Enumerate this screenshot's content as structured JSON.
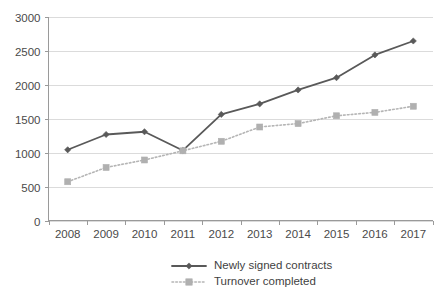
{
  "chart_data": {
    "type": "line",
    "title": "",
    "subtitle": "",
    "xlabel": "",
    "ylabel": "",
    "categories": [
      "2008",
      "2009",
      "2010",
      "2011",
      "2012",
      "2013",
      "2014",
      "2015",
      "2016",
      "2017"
    ],
    "series": [
      {
        "name": "Newly signed contracts",
        "values": [
          1040,
          1265,
          1305,
          1030,
          1560,
          1715,
          1920,
          2100,
          2435,
          2640
        ],
        "color": "#595959",
        "line_style": "solid",
        "marker": "diamond"
      },
      {
        "name": "Turnover completed",
        "values": [
          570,
          780,
          890,
          1025,
          1165,
          1375,
          1425,
          1540,
          1590,
          1680
        ],
        "color": "#b0b0b0",
        "line_style": "dotted",
        "marker": "square"
      }
    ],
    "ylim": [
      0,
      3000
    ],
    "yticks": [
      0,
      500,
      1000,
      1500,
      2000,
      2500,
      3000
    ],
    "ytick_labels": [
      "0",
      "500",
      "1000",
      "1500",
      "2000",
      "2500",
      "3000"
    ],
    "xtick_labels": [
      "2008",
      "2009",
      "2010",
      "2011",
      "2012",
      "2013",
      "2014",
      "2015",
      "2016",
      "2017"
    ],
    "grid": true,
    "grid_axis": "y",
    "legend_position": "bottom",
    "legend_entries": [
      "Newly signed contracts",
      "Turnover completed"
    ],
    "annotations": [],
    "colors": {
      "series_1": "#595959",
      "series_2": "#b0b0b0",
      "gridline": "#d2d2d2",
      "axis": "#9a9a9a",
      "text": "#4a4a4a",
      "background": "#ffffff"
    }
  }
}
